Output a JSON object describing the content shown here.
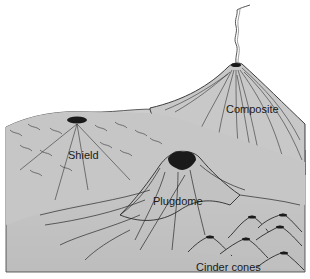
{
  "figure": {
    "type": "illustration",
    "labels": {
      "composite": "Composite",
      "shield": "Shield",
      "plugdome": "Plugdome",
      "cinder_cones": "Cinder cones"
    }
  },
  "colors": {
    "background": "#ffffff",
    "ground": "#c4c4c4",
    "ground_dark": "#b3b3b3",
    "ink": "#2a2a2a",
    "crater": "#1a1a1a"
  }
}
